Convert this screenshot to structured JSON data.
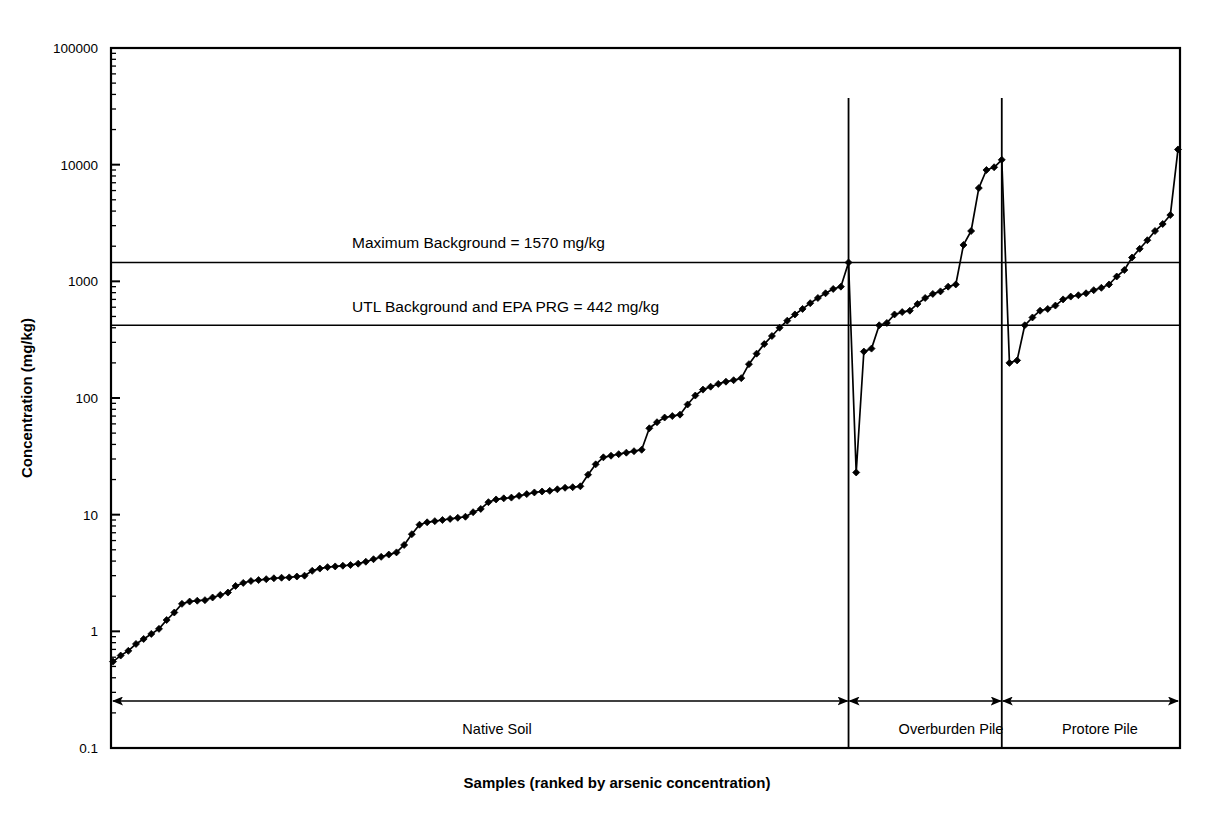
{
  "chart_data": {
    "type": "line",
    "title": "",
    "subtitle": "",
    "xlabel": "Samples (ranked by arsenic concentration)",
    "ylabel": "Concentration (mg/kg)",
    "yscale": "log",
    "ylim": [
      0.1,
      100000
    ],
    "ytick_labels": [
      "100000",
      "10000",
      "1000",
      "100",
      "10",
      "1",
      "0.1"
    ],
    "ytick_values": [
      100000,
      10000,
      1000,
      100,
      10,
      1,
      0.1
    ],
    "grid": false,
    "legend": "none",
    "xtick_labels": [],
    "series": [
      {
        "name": "Arsenic concentration (ranked)",
        "marker": "diamond",
        "color": "#000000",
        "values": [
          0.55,
          0.62,
          0.68,
          0.78,
          0.86,
          0.95,
          1.05,
          1.25,
          1.45,
          1.72,
          1.8,
          1.83,
          1.85,
          1.95,
          2.05,
          2.15,
          2.45,
          2.6,
          2.7,
          2.75,
          2.8,
          2.85,
          2.88,
          2.9,
          2.95,
          3.0,
          3.3,
          3.45,
          3.55,
          3.6,
          3.65,
          3.7,
          3.8,
          3.95,
          4.15,
          4.35,
          4.55,
          4.75,
          5.5,
          6.8,
          8.2,
          8.6,
          8.8,
          9.0,
          9.2,
          9.4,
          9.6,
          10.5,
          11.2,
          12.8,
          13.5,
          13.8,
          14.0,
          14.5,
          15.0,
          15.5,
          15.8,
          16.0,
          16.5,
          17.0,
          17.2,
          17.5,
          22.0,
          27.0,
          31.0,
          32.0,
          33.0,
          34.0,
          35.0,
          36.0,
          55.0,
          62.0,
          68.0,
          70.0,
          72.0,
          88.0,
          105.0,
          118.0,
          125.0,
          132.0,
          138.0,
          142.0,
          148.0,
          195.0,
          240.0,
          290.0,
          340.0,
          400.0,
          460.0,
          520.0,
          580.0,
          650.0,
          720.0,
          790.0,
          860.0,
          900.0,
          1450.0,
          23.0,
          250.0,
          265.0,
          420.0,
          440.0,
          520.0,
          545.0,
          560.0,
          640.0,
          720.0,
          780.0,
          820.0,
          900.0,
          940.0,
          2050.0,
          2700.0,
          6300.0,
          9000.0,
          9500.0,
          11000.0,
          200.0,
          210.0,
          420.0,
          490.0,
          560.0,
          580.0,
          620.0,
          700.0,
          740.0,
          760.0,
          790.0,
          840.0,
          880.0,
          940.0,
          1100.0,
          1250.0,
          1600.0,
          1900.0,
          2250.0,
          2700.0,
          3100.0,
          3700.0,
          13500.0
        ]
      }
    ],
    "reference_lines": [
      {
        "id": "max-background",
        "label": "Maximum Background =  1570 mg/kg",
        "value": 1570,
        "plotted_value": 1450,
        "style": "solid"
      },
      {
        "id": "utl-background",
        "label": "UTL Background and EPA PRG =  442 mg/kg",
        "value": 442,
        "plotted_value": 420,
        "style": "solid"
      }
    ],
    "zones": [
      {
        "id": "native-soil",
        "label": "Native Soil",
        "start_index": 0,
        "end_index": 96
      },
      {
        "id": "overburden-pile",
        "label": "Overburden Pile",
        "start_index": 97,
        "end_index": 116
      },
      {
        "id": "protore-pile",
        "label": "Protore Pile",
        "start_index": 117,
        "end_index": 139
      }
    ],
    "dividers": [
      {
        "id": "divider-native-overburden",
        "after_index": 96
      },
      {
        "id": "divider-overburden-protore",
        "after_index": 116
      }
    ]
  },
  "annotations": {
    "max_background": "Maximum Background =  1570 mg/kg",
    "utl_background": "UTL Background and EPA PRG =  442 mg/kg"
  },
  "axes": {
    "y_title": "Concentration (mg/kg)",
    "x_title": "Samples (ranked by arsenic concentration)",
    "y_ticks": [
      "100000",
      "10000",
      "1000",
      "100",
      "10",
      "1",
      "0.1"
    ]
  },
  "zone_labels": {
    "native": "Native Soil",
    "overburden": "Overburden Pile",
    "protore": "Protore Pile"
  },
  "colors": {
    "line": "#000000",
    "marker": "#000000",
    "axis": "#000000",
    "background": "#ffffff"
  }
}
